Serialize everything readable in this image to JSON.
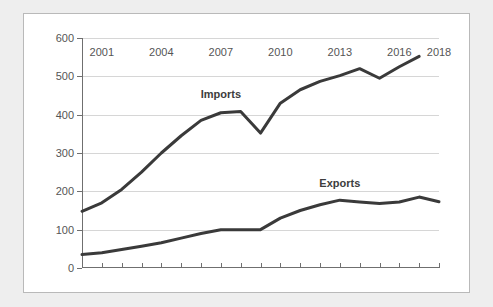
{
  "chart_data": {
    "type": "line",
    "title": "",
    "subtitle": "",
    "xlabel": "",
    "ylabel": "",
    "xlim": [
      2000,
      2018
    ],
    "ylim": [
      0,
      600
    ],
    "y_ticks": [
      0,
      100,
      200,
      300,
      400,
      500,
      600
    ],
    "y_tick_labels": [
      "0",
      "100",
      "200",
      "300",
      "400",
      "500",
      "600"
    ],
    "x_ticks": [
      2000,
      2001,
      2002,
      2003,
      2004,
      2005,
      2006,
      2007,
      2008,
      2009,
      2010,
      2011,
      2012,
      2013,
      2014,
      2015,
      2016,
      2017,
      2018
    ],
    "x_tick_labels": [
      "",
      "2001",
      "",
      "",
      "2004",
      "",
      "",
      "2007",
      "",
      "",
      "2010",
      "",
      "",
      "2013",
      "",
      "",
      "2016",
      "",
      "2018"
    ],
    "grid": "horizontal",
    "legend": "inline-annotations",
    "line_color": "#3a3a3a",
    "grid_color": "#d6d6d6",
    "axis_color": "#6f6f6f",
    "panel_color": "#ffffff",
    "page_color": "#eeeeee",
    "series": [
      {
        "name": "Imports",
        "label_x": 2007,
        "label_y": 455,
        "x": [
          2000,
          2001,
          2002,
          2003,
          2004,
          2005,
          2006,
          2007,
          2008,
          2009,
          2010,
          2011,
          2012,
          2013,
          2014,
          2015,
          2016,
          2017
        ],
        "values": [
          148,
          170,
          205,
          250,
          300,
          345,
          385,
          405,
          408,
          352,
          430,
          465,
          487,
          502,
          520,
          495,
          525,
          552
        ]
      },
      {
        "name": "Exports",
        "label_x": 2013,
        "label_y": 222,
        "x": [
          2000,
          2001,
          2002,
          2003,
          2004,
          2005,
          2006,
          2007,
          2008,
          2009,
          2010,
          2011,
          2012,
          2013,
          2014,
          2015,
          2016,
          2017,
          2018
        ],
        "values": [
          35,
          40,
          48,
          57,
          66,
          78,
          90,
          100,
          100,
          100,
          130,
          150,
          165,
          177,
          172,
          168,
          172,
          185,
          173
        ]
      }
    ]
  }
}
